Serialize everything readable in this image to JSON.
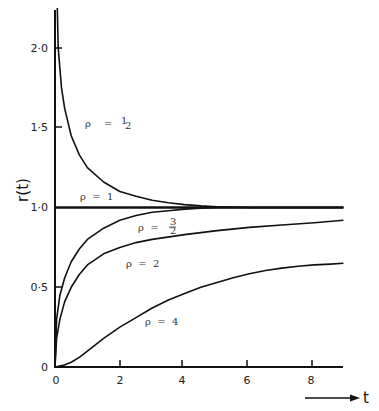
{
  "chart_data": {
    "type": "line",
    "title": "",
    "xlabel": "t",
    "ylabel": "r(t)",
    "xlim": [
      0,
      8.9
    ],
    "ylim": [
      0,
      2.25
    ],
    "grid": false,
    "legend": "inline labels on curves",
    "x_ticks": [
      "0",
      "2",
      "4",
      "6",
      "8"
    ],
    "y_ticks": [
      "0",
      "0·5",
      "1·0",
      "1·5",
      "2·0"
    ],
    "series": [
      {
        "name": "ρ = 1/2",
        "label_text": "ρ = ½",
        "x": [
          0.07,
          0.1,
          0.2,
          0.3,
          0.5,
          0.75,
          1.0,
          1.5,
          2.0,
          2.5,
          3.0,
          3.5,
          4.0,
          4.5,
          5.0,
          6.0,
          7.0,
          8.0,
          8.9
        ],
        "y": [
          2.25,
          2.0,
          1.75,
          1.62,
          1.45,
          1.33,
          1.25,
          1.16,
          1.1,
          1.07,
          1.045,
          1.03,
          1.018,
          1.01,
          1.005,
          1.0,
          1.0,
          1.0,
          1.0
        ]
      },
      {
        "name": "ρ = 1",
        "label_text": "ρ = 1",
        "x": [
          0,
          8.9
        ],
        "y": [
          1.0,
          1.0
        ]
      },
      {
        "name": "ρ = 3/2",
        "label_text": "ρ = 3/2",
        "x": [
          0,
          0.05,
          0.15,
          0.3,
          0.5,
          0.75,
          1.0,
          1.5,
          2.0,
          2.5,
          3.0,
          3.5,
          4.0,
          4.5,
          5.0,
          6.0,
          7.0,
          8.0,
          8.9
        ],
        "y": [
          0,
          0.3,
          0.45,
          0.56,
          0.66,
          0.74,
          0.8,
          0.87,
          0.92,
          0.95,
          0.97,
          0.98,
          0.99,
          0.995,
          1.0,
          1.0,
          1.0,
          1.0,
          1.0
        ]
      },
      {
        "name": "ρ = 2",
        "label_text": "ρ = 2",
        "x": [
          0,
          0.05,
          0.15,
          0.3,
          0.5,
          0.75,
          1.0,
          1.5,
          2.0,
          2.5,
          3.0,
          4.0,
          5.0,
          6.0,
          7.0,
          8.0,
          8.9
        ],
        "y": [
          0,
          0.18,
          0.3,
          0.41,
          0.5,
          0.58,
          0.64,
          0.71,
          0.75,
          0.78,
          0.8,
          0.83,
          0.855,
          0.875,
          0.89,
          0.905,
          0.92
        ]
      },
      {
        "name": "ρ = 4",
        "label_text": "ρ = 4",
        "x": [
          0,
          0.25,
          0.5,
          0.75,
          1.0,
          1.5,
          2.0,
          2.5,
          3.0,
          3.5,
          4.0,
          4.5,
          5.0,
          5.5,
          6.0,
          6.5,
          7.0,
          7.5,
          8.0,
          8.5,
          8.9
        ],
        "y": [
          0,
          0.01,
          0.03,
          0.06,
          0.1,
          0.18,
          0.25,
          0.31,
          0.37,
          0.42,
          0.46,
          0.5,
          0.53,
          0.56,
          0.585,
          0.605,
          0.62,
          0.632,
          0.64,
          0.645,
          0.65
        ]
      }
    ],
    "annotations": [
      {
        "text": "ρ = ½",
        "at": [
          1.1,
          1.47
        ]
      },
      {
        "text": "ρ = 1",
        "at": [
          1.1,
          1.04
        ]
      },
      {
        "text": "ρ = 3/2",
        "at": [
          2.6,
          0.93
        ]
      },
      {
        "text": "ρ = 2",
        "at": [
          1.9,
          0.72
        ]
      },
      {
        "text": "ρ = 4",
        "at": [
          2.6,
          0.3
        ]
      }
    ]
  },
  "labels": {
    "y_axis_title": "r(t)",
    "x_axis_title": "t",
    "y_tick_0": "0",
    "y_tick_05": "0·5",
    "y_tick_10": "1·0",
    "y_tick_15": "1·5",
    "y_tick_20": "2·0",
    "x_tick_0": "0",
    "x_tick_2": "2",
    "x_tick_4": "4",
    "x_tick_6": "6",
    "x_tick_8": "8",
    "curve_half_rho": "ρ",
    "curve_half_eq": "=",
    "curve_half_num": "1",
    "curve_half_den": "2",
    "curve_one": "ρ  =  1",
    "curve_three_half_prefix": "ρ  =",
    "curve_three_half_num": "3",
    "curve_three_half_den": "2",
    "curve_two": "ρ  =  2",
    "curve_four": "ρ  =  4"
  }
}
